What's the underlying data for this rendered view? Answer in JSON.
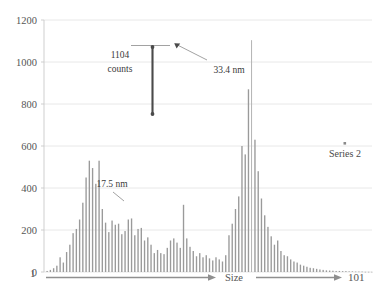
{
  "chart_data": {
    "type": "bar",
    "title": "",
    "subtitle": "",
    "xlabel": "Size",
    "ylabel": "",
    "xlim": [
      1,
      101
    ],
    "ylim": [
      0,
      1200
    ],
    "grid": true,
    "legend_position": "right-middle",
    "y_ticks": [
      0,
      200,
      400,
      600,
      800,
      1000,
      1200
    ],
    "y_tick_labels": [
      "0",
      "200",
      "400",
      "600",
      "800",
      "1000",
      "1200"
    ],
    "x_axis_start_label": "1",
    "x_axis_end_label": "101",
    "series": [
      {
        "name": "Series 2",
        "categories": [
          1,
          2,
          3,
          4,
          5,
          6,
          7,
          8,
          9,
          10,
          11,
          12,
          13,
          14,
          15,
          16,
          17,
          18,
          19,
          20,
          21,
          22,
          23,
          24,
          25,
          26,
          27,
          28,
          29,
          30,
          31,
          32,
          33,
          34,
          35,
          36,
          37,
          38,
          39,
          40,
          41,
          42,
          43,
          44,
          45,
          46,
          47,
          48,
          49,
          50,
          51,
          52,
          53,
          54,
          55,
          56,
          57,
          58,
          59,
          60,
          61,
          62,
          63,
          64,
          65,
          66,
          67,
          68,
          69,
          70,
          71,
          72,
          73,
          74,
          75,
          76,
          77,
          78,
          79,
          80,
          81,
          82,
          83,
          84,
          85,
          86,
          87,
          88,
          89,
          90,
          91,
          92,
          93,
          94,
          95,
          96,
          97,
          98,
          99,
          100,
          101
        ],
        "values": [
          5,
          10,
          18,
          30,
          70,
          45,
          95,
          130,
          185,
          205,
          250,
          330,
          450,
          530,
          495,
          420,
          530,
          300,
          235,
          190,
          245,
          225,
          230,
          180,
          195,
          250,
          255,
          175,
          205,
          210,
          150,
          165,
          130,
          90,
          105,
          90,
          85,
          115,
          150,
          160,
          140,
          115,
          320,
          160,
          120,
          100,
          75,
          90,
          70,
          80,
          65,
          55,
          70,
          60,
          50,
          80,
          175,
          230,
          300,
          360,
          600,
          560,
          870,
          1104,
          630,
          480,
          350,
          270,
          215,
          170,
          130,
          150,
          100,
          80,
          75,
          60,
          50,
          45,
          35,
          30,
          25,
          20,
          18,
          15,
          12,
          10,
          8,
          7,
          6,
          5,
          5,
          4,
          4,
          3,
          3,
          2,
          2,
          2,
          1,
          1,
          1
        ]
      }
    ],
    "annotations": [
      {
        "id": "counts-annotation",
        "text_line1": "1104",
        "text_line2": "counts",
        "value": 1104,
        "unit": "counts"
      },
      {
        "id": "peak-annotation",
        "text": "33.4 nm",
        "value": 33.4,
        "unit": "nm"
      },
      {
        "id": "shoulder-annotation",
        "text": "17.5 nm",
        "value": 17.5,
        "unit": "nm"
      }
    ]
  },
  "legend": {
    "entries": [
      {
        "label": "Series 2",
        "marker": "square-marker",
        "color": "#8a8a8a"
      }
    ]
  },
  "axis": {
    "x_title": "Size",
    "x_start": "1",
    "x_end": "101"
  },
  "colors": {
    "bar": "#9a9a9a",
    "grid": "#e2e2e2",
    "annotation": "#4a4a4a",
    "axis_arrow": "#8f8f8f"
  }
}
